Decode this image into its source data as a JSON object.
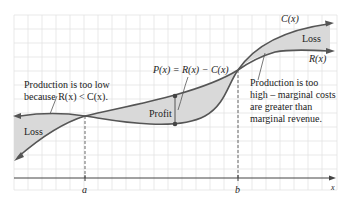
{
  "diagram": {
    "curves": {
      "cost": "C(x)",
      "revenue": "R(x)"
    },
    "axis": {
      "x_label": "x",
      "ticks": [
        "a",
        "b"
      ]
    },
    "regions": {
      "left_loss": "Loss",
      "profit": "Profit",
      "right_loss": "Loss"
    },
    "annotations": {
      "profit_formula": "P(x) = R(x) − C(x)",
      "too_low_line1": "Production is too low",
      "too_low_line2": "because R(x) < C(x).",
      "too_high_line1": "Production is too",
      "too_high_line2": "high – marginal costs",
      "too_high_line3": "are greater than",
      "too_high_line4": "marginal revenue."
    },
    "colors": {
      "curve": "#555555",
      "shade": "#d9d9d9",
      "grid": "#e3e3e3",
      "axis": "#444444"
    }
  }
}
